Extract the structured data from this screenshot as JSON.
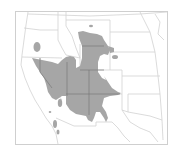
{
  "map": {
    "title": "",
    "region": "Western United States",
    "colors": {
      "background": "#ffffff",
      "border": "#c8c8c8",
      "range_fill": "#a6a6a6",
      "state_lines": "#d0d0d0",
      "internal_range_lines": "#7a7a7a"
    },
    "legend": []
  }
}
